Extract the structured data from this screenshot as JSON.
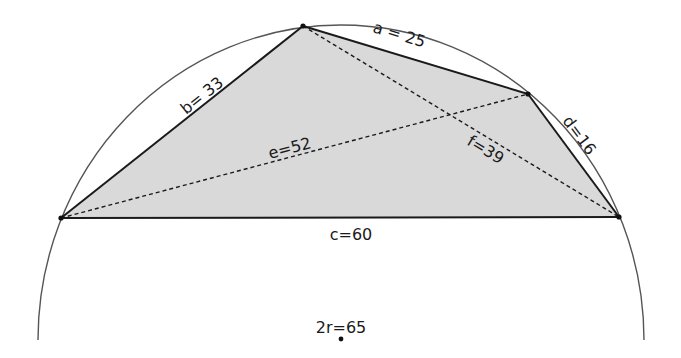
{
  "figure": {
    "colors": {
      "fill": "#d9d9d9",
      "stroke": "#1a1a1a",
      "circle": "#555555",
      "background": "#ffffff"
    },
    "labels": {
      "a": "a = 25",
      "b": "b= 33",
      "c": "c=60",
      "d": "d=16",
      "e": "e=52",
      "f": "f=39",
      "diameter": "2r=65"
    },
    "values": {
      "a": 25,
      "b": 33,
      "c": 60,
      "d": 16,
      "e": 52,
      "f": 39,
      "2r": 65
    }
  }
}
